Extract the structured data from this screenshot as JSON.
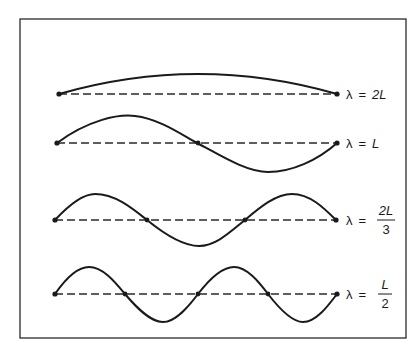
{
  "figure": {
    "frame_color": "#1a1a1a",
    "modes": [
      {
        "id": "mode-1",
        "label_lhs": "λ",
        "label_eq": "=",
        "label_rhs": "2L",
        "fraction": false,
        "half_wavelengths": 1
      },
      {
        "id": "mode-2",
        "label_lhs": "λ",
        "label_eq": "=",
        "label_rhs": "L",
        "fraction": false,
        "half_wavelengths": 2
      },
      {
        "id": "mode-3",
        "label_lhs": "λ",
        "label_eq": "=",
        "label_num": "2L",
        "label_den": "3",
        "fraction": true,
        "half_wavelengths": 3
      },
      {
        "id": "mode-4",
        "label_lhs": "λ",
        "label_eq": "=",
        "label_num": "L",
        "label_den": "2",
        "fraction": true,
        "half_wavelengths": 4
      }
    ]
  }
}
